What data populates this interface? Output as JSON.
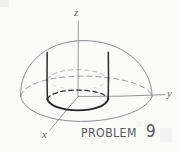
{
  "figure": {
    "title_word": "PROBLEM",
    "problem_number": "9",
    "axes": {
      "z_label": "z",
      "y_label": "y",
      "x_label": "x"
    },
    "colors": {
      "background": "#fbfbfa",
      "pencil_light": "#8a8a90",
      "pencil_dark": "#2b2b2e",
      "label_ink": "#58585e"
    },
    "shapes": [
      {
        "name": "hemisphere-dome-arc",
        "style": "solid-light"
      },
      {
        "name": "hemisphere-base-front-arc",
        "style": "solid-light"
      },
      {
        "name": "hemisphere-base-back-arc",
        "style": "dashed-light"
      },
      {
        "name": "cylinder-left-wall",
        "style": "solid-dark"
      },
      {
        "name": "cylinder-right-wall",
        "style": "solid-dark"
      },
      {
        "name": "cylinder-base-front-arc",
        "style": "solid-dark"
      },
      {
        "name": "cylinder-base-back-arc",
        "style": "dashed-dark"
      },
      {
        "name": "cylinder-top-front-arc",
        "style": "dashed-light"
      },
      {
        "name": "cylinder-top-back-arc",
        "style": "dashed-light"
      },
      {
        "name": "axis-z-line",
        "style": "solid-light"
      },
      {
        "name": "axis-y-line",
        "style": "solid-light"
      },
      {
        "name": "axis-x-line",
        "style": "solid-light"
      }
    ]
  }
}
